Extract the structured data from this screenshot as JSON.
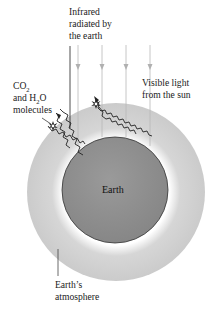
{
  "labels": {
    "infrared": [
      "Infrared",
      "radiated by",
      "the earth"
    ],
    "visible": [
      "Visible light",
      "from the sun"
    ],
    "molecules": {
      "line1_main": "CO",
      "line1_sub": "2",
      "line2_prefix": "and H",
      "line2_sub": "2",
      "line2_suffix": "O",
      "line3": "molecules"
    },
    "earth": "Earth",
    "atmosphere": [
      "Earth’s",
      "atmosphere"
    ]
  },
  "colors": {
    "atmosphere": "#cfcfcf",
    "atmosphere_glow": "#ffffff",
    "earth": "#8f8f8f",
    "earth_outline": "#333333",
    "sunlight_arrows": "#b8b8b8",
    "infrared_lines": "#222222",
    "text": "#222222"
  },
  "elements": {
    "sunlight_arrow_count": 4,
    "infrared_wave_count": 4,
    "molecule_count": 2
  }
}
